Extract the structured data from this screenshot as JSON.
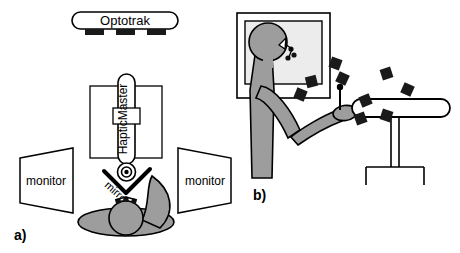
{
  "figure": {
    "caption_panels": [
      "a)",
      "b)"
    ],
    "panel_a": {
      "label": "a)",
      "view": "top-down setup view",
      "devices": {
        "optotrak": {
          "label": "Optotrak",
          "camera_count": 3,
          "shape": "rounded-bar-with-three-camera-blocks"
        },
        "haptic_master": {
          "label": "HapticMaster",
          "text_orientation": "rotated-90-ccw",
          "shape": "vertical-capsule-with-collar-inside-box"
        },
        "mirror": {
          "label": "mirror",
          "text_orientation": "rotated-diagonal",
          "shape": "v-shaped-reflector"
        },
        "monitor_left": {
          "label": "monitor"
        },
        "monitor_right": {
          "label": "monitor"
        }
      },
      "subject": {
        "view": "overhead",
        "parts": [
          "head",
          "shoulders",
          "left-arm",
          "right-arm",
          "head-markers"
        ]
      }
    },
    "panel_b": {
      "label": "b)",
      "view": "side setup view",
      "elements": {
        "screen": {
          "name": "projection-screen",
          "shape": "framed-rectangle"
        },
        "subject": {
          "parts": [
            "head",
            "nose",
            "torso",
            "upper-arm",
            "forearm",
            "hand"
          ],
          "head_markers": 3
        },
        "table": {
          "name": "support-table",
          "shape": "rounded-top-on-pedestal"
        },
        "markers": {
          "name": "optotrak-markers",
          "count": 9,
          "shape": "tilted-black-square"
        },
        "stylus": {
          "name": "stylus-pointer",
          "shape": "thin-vertical-pin"
        }
      }
    },
    "colors": {
      "outline": "#000000",
      "body_gray": "#9d9d9d",
      "screen_gray": "#ececec",
      "marker_black": "#1a1a1a",
      "background": "#ffffff"
    }
  }
}
